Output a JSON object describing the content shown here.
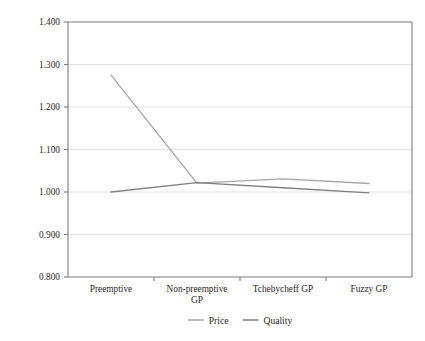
{
  "chart_data": {
    "type": "line",
    "title": "",
    "xlabel": "",
    "ylabel": "",
    "categories": [
      "Preemptive",
      "Non-preemptive GP",
      "Tchebycheff GP",
      "Fuzzy GP"
    ],
    "category_lines": [
      [
        "Preemptive"
      ],
      [
        "Non-preemptive",
        "GP"
      ],
      [
        "Tchebycheff GP"
      ],
      [
        "Fuzzy GP"
      ]
    ],
    "series": [
      {
        "name": "Price",
        "values": [
          1.275,
          1.021,
          1.031,
          1.02
        ],
        "color": "#a6a6a6"
      },
      {
        "name": "Quality",
        "values": [
          1.0,
          1.022,
          1.01,
          0.998
        ],
        "color": "#808080"
      }
    ],
    "ylim": [
      0.8,
      1.4
    ],
    "ytick_values": [
      1.4,
      1.3,
      1.2,
      1.1,
      1.0,
      0.9,
      0.8
    ],
    "ytick_labels": [
      "1.400",
      "1.300",
      "1.200",
      "1.100",
      "1.000",
      "0.900",
      "0.800"
    ],
    "grid": "horizontal",
    "legend_position": "bottom",
    "legend": [
      {
        "label": "Price",
        "color": "#a6a6a6"
      },
      {
        "label": "Quality",
        "color": "#808080"
      }
    ],
    "axis_color": "#7a7a7a",
    "grid_color": "#e2e2e2",
    "plot_background": "#ffffff"
  }
}
